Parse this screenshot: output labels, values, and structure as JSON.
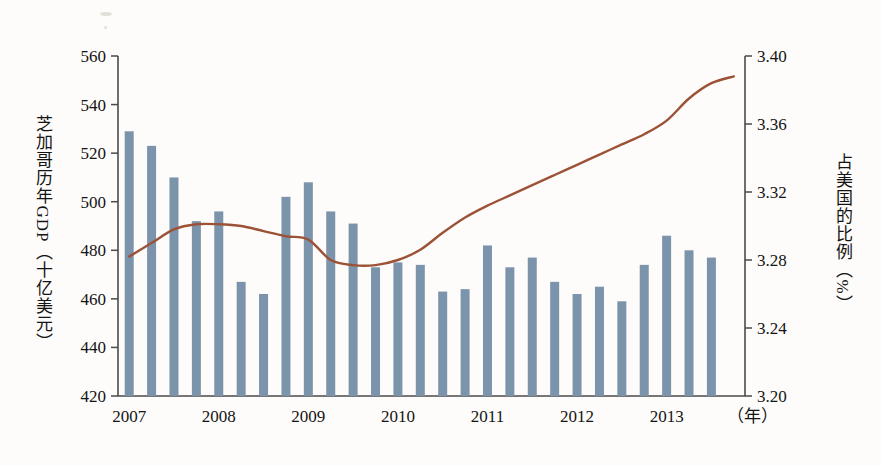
{
  "chart_data": {
    "type": "bar",
    "title": "",
    "subtitle": "",
    "xlabel": "（年）",
    "ylabel": "芝加哥历年GDP（十亿美元）",
    "y2label": "占美国的比例（%）",
    "ylim": [
      420,
      560
    ],
    "y2lim": [
      3.2,
      3.4
    ],
    "yticks": [
      "420",
      "440",
      "460",
      "480",
      "500",
      "520",
      "540",
      "560"
    ],
    "ytick_values": [
      420,
      440,
      460,
      480,
      500,
      520,
      540,
      560
    ],
    "y2ticks": [
      "3.20",
      "3.24",
      "3.28",
      "3.32",
      "3.36",
      "3.40"
    ],
    "y2tick_values": [
      3.2,
      3.24,
      3.28,
      3.32,
      3.36,
      3.4
    ],
    "xticks": [
      "2007",
      "2008",
      "2009",
      "2010",
      "2011",
      "2012",
      "2013"
    ],
    "xtick_values": [
      2007,
      2008,
      2009,
      2010,
      2011,
      2012,
      2013
    ],
    "grid": false,
    "legend": "none",
    "bar_color": "#7b94ac",
    "line_color": "#9c5236",
    "axis_color": "#4a4a4a",
    "background": "#fdfcfa",
    "series": [
      {
        "name": "芝加哥历年GDP（十亿美元）",
        "type": "bar",
        "axis": "left",
        "values": [
          529,
          523,
          510,
          492,
          496,
          467,
          462,
          502,
          508,
          496,
          491,
          473,
          475,
          474,
          463,
          464,
          482,
          473,
          477,
          467,
          462,
          465,
          459,
          474,
          486,
          480,
          477
        ]
      },
      {
        "name": "占美国的比例（%）",
        "type": "line",
        "axis": "right",
        "values": [
          3.282,
          3.29,
          3.298,
          3.301,
          3.301,
          3.3,
          3.297,
          3.294,
          3.292,
          3.28,
          3.277,
          3.277,
          3.28,
          3.286,
          3.296,
          3.305,
          3.312,
          3.318,
          3.324,
          3.33,
          3.336,
          3.342,
          3.348,
          3.354,
          3.362,
          3.375,
          3.384,
          3.388
        ]
      }
    ]
  }
}
